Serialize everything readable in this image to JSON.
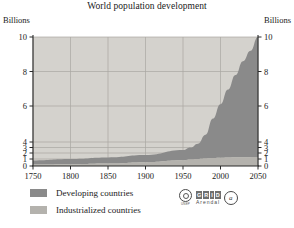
{
  "chart_data": {
    "type": "area",
    "title": "World population development",
    "subtitle": "",
    "xlabel": "",
    "ylabel": "Billions",
    "ylabel_right": "Billions",
    "stacked": true,
    "grid": true,
    "legend_position": "bottom-left",
    "xlim": [
      1750,
      2050
    ],
    "ylim": [
      0,
      10
    ],
    "x_ticks": [
      "1750",
      "1800",
      "1850",
      "1900",
      "1950",
      "2000",
      "2050"
    ],
    "y_ticks": [
      "0",
      "1",
      "2",
      "3",
      "4",
      "6",
      "8",
      "10"
    ],
    "y_axis_note": "non-linear: ticks 0,1,2,3,4 compressed near baseline, then 6,8,10",
    "x": [
      1750,
      1800,
      1850,
      1900,
      1950,
      1960,
      1970,
      1980,
      1990,
      2000,
      2010,
      2020,
      2030,
      2040,
      2050
    ],
    "series": [
      {
        "name": "Industrialized countries",
        "color": "#b4b2ad",
        "values": [
          0.2,
          0.25,
          0.35,
          0.55,
          0.81,
          0.92,
          1.01,
          1.08,
          1.15,
          1.19,
          1.24,
          1.28,
          1.3,
          1.31,
          1.32
        ]
      },
      {
        "name": "Developing countries",
        "color": "#8a8a8a",
        "values": [
          0.6,
          0.76,
          0.89,
          1.08,
          1.72,
          2.07,
          2.67,
          3.34,
          4.12,
          4.9,
          5.7,
          6.5,
          7.3,
          7.9,
          8.7
        ]
      }
    ],
    "totals": [
      0.8,
      1.0,
      1.25,
      1.65,
      2.53,
      3.0,
      3.7,
      4.4,
      5.3,
      6.1,
      6.95,
      7.8,
      8.6,
      9.2,
      10.0
    ]
  },
  "title": "World population development",
  "axes": {
    "left_unit": "Billions",
    "right_unit": "Billions"
  },
  "legend": {
    "items": [
      {
        "label": "Developing countries",
        "color": "#8a8a8a"
      },
      {
        "label": "Industrialized countries",
        "color": "#b4b2ad"
      }
    ]
  },
  "logo": {
    "unep_text": "UNEP",
    "grid_blocks": [
      "G",
      "R",
      "I",
      "D"
    ],
    "grid_word": "GRID",
    "arendal": "Arendal",
    "third_mark": "a"
  },
  "colors": {
    "plot_background": "#d4d2cd",
    "developing": "#8a8a8a",
    "industrialized": "#b4b2ad",
    "gridline": "#a9a7a2",
    "axis": "#2a2a2a",
    "page_background": "#ffffff"
  }
}
